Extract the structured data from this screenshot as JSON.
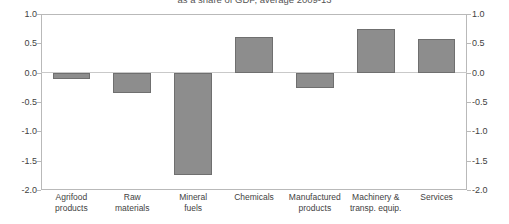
{
  "chart_data": {
    "type": "bar",
    "title": "as a share of GDP, average 2009-13",
    "xlabel": "",
    "ylabel": "",
    "ylim": [
      -2.0,
      1.0
    ],
    "yticks": [
      "1.0",
      "0.5",
      "0.0",
      "-0.5",
      "-1.0",
      "-1.5",
      "-2.0"
    ],
    "ytick_values": [
      1.0,
      0.5,
      0.0,
      -0.5,
      -1.0,
      -1.5,
      -2.0
    ],
    "dual_axis": true,
    "grid": false,
    "legend": "none",
    "bar_color": "#8d8d8d",
    "bar_edge_color": "#6f6f6f",
    "categories": [
      "Agrifood products",
      "Raw materials",
      "Mineral fuels",
      "Chemicals",
      "Manufactured products",
      "Machinery & transp. equip.",
      "Services"
    ],
    "category_lines": [
      [
        "Agrifood",
        "products"
      ],
      [
        "Raw",
        "materials"
      ],
      [
        "Mineral",
        "fuels"
      ],
      [
        "Chemicals",
        ""
      ],
      [
        "Manufactured",
        "products"
      ],
      [
        "Machinery &",
        "transp. equip."
      ],
      [
        "Services",
        ""
      ]
    ],
    "values": [
      -0.1,
      -0.34,
      -1.75,
      0.61,
      -0.26,
      0.75,
      0.58
    ]
  }
}
